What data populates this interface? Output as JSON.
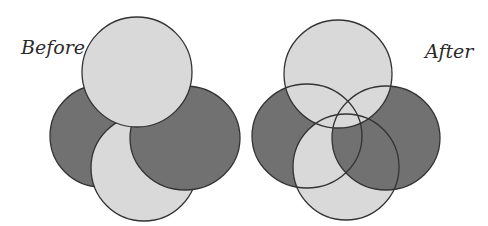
{
  "labels": {
    "before": "Before",
    "after": "After"
  },
  "colors": {
    "dark": "#717171",
    "light": "#d9d9d9",
    "stroke": "#333333"
  },
  "diagrams": [
    {
      "name": "before",
      "shapes": [
        {
          "id": "left-ellipse",
          "tone": "dark"
        },
        {
          "id": "bottom-circle",
          "tone": "light"
        },
        {
          "id": "right-ellipse",
          "tone": "dark"
        },
        {
          "id": "top-circle",
          "tone": "light"
        }
      ]
    },
    {
      "name": "after",
      "shapes": [
        {
          "id": "left-ellipse",
          "tone": "dark"
        },
        {
          "id": "bottom-circle",
          "tone": "light"
        },
        {
          "id": "right-ellipse",
          "tone": "dark"
        },
        {
          "id": "top-circle",
          "tone": "light"
        }
      ],
      "outlines_on_top": true
    }
  ]
}
